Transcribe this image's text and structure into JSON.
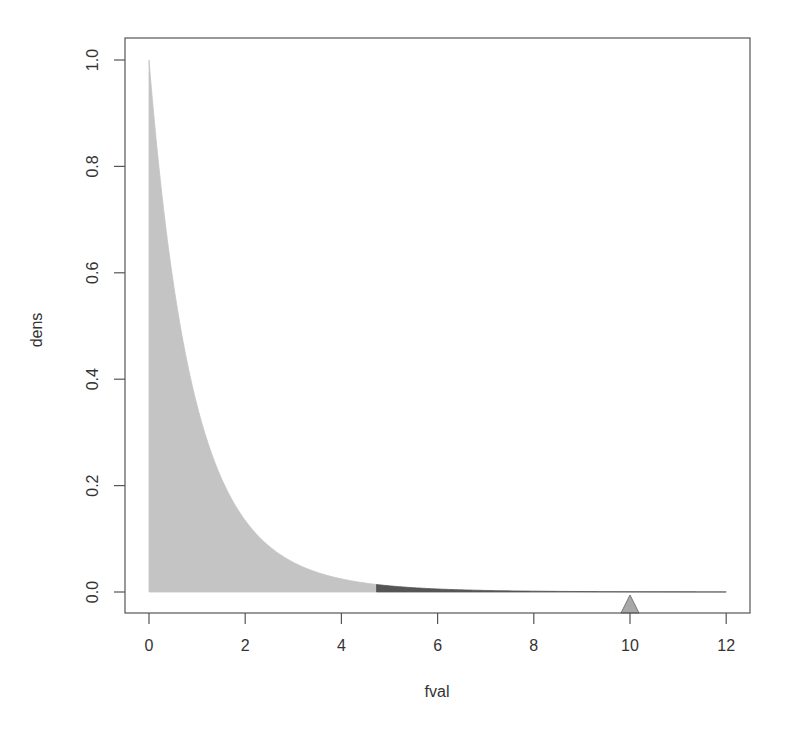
{
  "chart_data": {
    "type": "area",
    "title": "",
    "xlabel": "fval",
    "ylabel": "dens",
    "xlim": [
      0,
      12
    ],
    "ylim": [
      0,
      1.0
    ],
    "x_ticks": [
      "0",
      "2",
      "4",
      "6",
      "8",
      "10",
      "12"
    ],
    "y_ticks": [
      "0.0",
      "0.2",
      "0.4",
      "0.6",
      "0.8",
      "1.0"
    ],
    "grid": false,
    "legend": null,
    "series": [
      {
        "name": "dens",
        "x": [
          0,
          0.5,
          1,
          1.5,
          2,
          2.5,
          3,
          3.5,
          4,
          4.5,
          5,
          6,
          7,
          8,
          9,
          10,
          11,
          12
        ],
        "values": [
          1.0,
          0.58,
          0.35,
          0.215,
          0.135,
          0.086,
          0.056,
          0.037,
          0.025,
          0.017,
          0.012,
          0.006,
          0.003,
          0.0015,
          0.0008,
          0.0004,
          0.0002,
          0.0001
        ]
      }
    ],
    "regions": [
      {
        "name": "acceptance-region",
        "from": 0,
        "to": 4.73,
        "color": "#c4c4c4"
      },
      {
        "name": "rejection-region",
        "from": 4.73,
        "to": 12,
        "color": "#555555"
      }
    ],
    "markers": [
      {
        "name": "observed-statistic",
        "x": 10,
        "shape": "triangle",
        "color": "#a8a8a8"
      }
    ]
  },
  "axes": {
    "x_label": "fval",
    "y_label": "dens"
  }
}
